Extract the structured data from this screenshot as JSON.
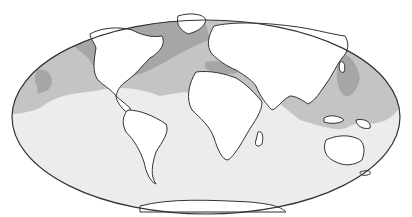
{
  "map": {
    "projection": "Mollweide (oval world map)",
    "colors": {
      "background": "#ffffff",
      "ocean_light": "#ececec",
      "zone_medium": "#c4c4c4",
      "zone_dark": "#a6a6a6",
      "land": "#ffffff",
      "outline": "#333333"
    },
    "regions": [
      {
        "name": "North Atlantic",
        "shade": "dark"
      },
      {
        "name": "North Pacific (east)",
        "shade": "medium"
      },
      {
        "name": "Gulf of Mexico / Caribbean",
        "shade": "medium"
      },
      {
        "name": "Mediterranean Sea",
        "shade": "dark"
      },
      {
        "name": "Western Pacific / East Asia",
        "shade": "dark"
      },
      {
        "name": "Southeast Asia / Indonesia",
        "shade": "medium"
      },
      {
        "name": "Southern oceans",
        "shade": "light"
      }
    ]
  }
}
